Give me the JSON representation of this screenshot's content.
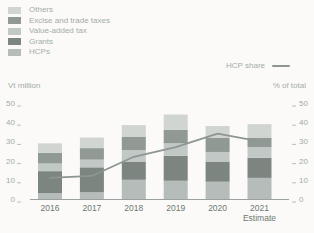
{
  "legend": {
    "items": [
      {
        "label": "Others",
        "color": "#d0d5d2"
      },
      {
        "label": "Excise and trade taxes",
        "color": "#909994"
      },
      {
        "label": "Value-added tax",
        "color": "#c2c8c5"
      },
      {
        "label": "Grants",
        "color": "#7d8581"
      },
      {
        "label": "HCPs",
        "color": "#b5bcb9"
      }
    ],
    "line_item": {
      "label": "HCP share",
      "color": "#8d9692"
    }
  },
  "axes": {
    "left_title": "Vt million",
    "right_title": "% of total",
    "left_ticks": [
      0,
      10,
      20,
      30,
      40,
      50
    ],
    "right_ticks": [
      0,
      10,
      20,
      30,
      40,
      50
    ],
    "x_labels": [
      "2016",
      "2017",
      "2018",
      "2019",
      "2020",
      "2021"
    ],
    "x_sublabel": {
      "index": 5,
      "text": "Estimate"
    }
  },
  "chart_data": {
    "type": "bar",
    "subtype": "stacked-bars-with-line-overlay",
    "title": "",
    "categories": [
      "2016",
      "2017",
      "2018",
      "2019",
      "2020",
      "2021"
    ],
    "series": [
      {
        "name": "HCPs",
        "values": [
          3,
          3.5,
          10,
          9.5,
          9,
          11
        ],
        "color": "#b5bcb9"
      },
      {
        "name": "Grants",
        "values": [
          11.5,
          13,
          9.5,
          13,
          10.5,
          10.5
        ],
        "color": "#7d8581"
      },
      {
        "name": "Value-added tax",
        "values": [
          4,
          4,
          6,
          6.5,
          5,
          5.5
        ],
        "color": "#c2c8c5"
      },
      {
        "name": "Excise and trade taxes",
        "values": [
          5.5,
          6,
          7,
          7,
          7.5,
          5
        ],
        "color": "#909994"
      },
      {
        "name": "Others",
        "values": [
          5,
          5.5,
          6,
          8,
          6,
          7
        ],
        "color": "#d0d5d2"
      }
    ],
    "line_series": {
      "name": "HCP share",
      "values": [
        11,
        12,
        22,
        27,
        34,
        30
      ],
      "axis": "right",
      "color": "#8d9692"
    },
    "xlabel": "",
    "ylabel_left": "Vt million",
    "ylabel_right": "% of total",
    "ylim": [
      0,
      50
    ],
    "grid": false,
    "legend_position": "top-left"
  }
}
